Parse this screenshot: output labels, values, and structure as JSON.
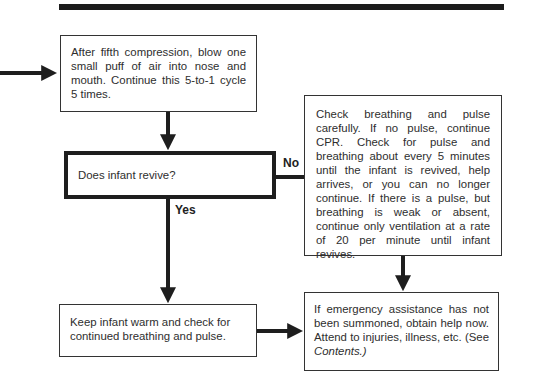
{
  "diagram": {
    "type": "flowchart",
    "nodes": {
      "step_ventilate": "After fifth compression, blow one small puff of air into nose and mouth. Continue this 5-to-1 cycle 5 times.",
      "decision_revive": "Does infant revive?",
      "no_branch": "Check breathing and pulse carefully. If no pulse, continue CPR. Check for pulse and breathing about every 5 minutes until the infant is revived, help arrives, or you can no longer continue. If there is a pulse, but breathing is weak or absent, continue only ventilation at a rate of 20 per minute until infant revives.",
      "yes_branch": "Keep infant warm and check for continued breathing and pulse.",
      "final_prefix": "If emergency assistance has not been summoned, obtain help now. Attend to injuries, illness, etc. (See ",
      "final_italic": "Contents.)"
    },
    "edge_labels": {
      "no": "No",
      "yes": "Yes"
    },
    "edges": [
      {
        "from": "incoming",
        "to": "step_ventilate"
      },
      {
        "from": "step_ventilate",
        "to": "decision_revive"
      },
      {
        "from": "decision_revive",
        "to": "no_branch",
        "label": "No"
      },
      {
        "from": "decision_revive",
        "to": "yes_branch",
        "label": "Yes"
      },
      {
        "from": "no_branch",
        "to": "final"
      },
      {
        "from": "yes_branch",
        "to": "final"
      }
    ]
  }
}
